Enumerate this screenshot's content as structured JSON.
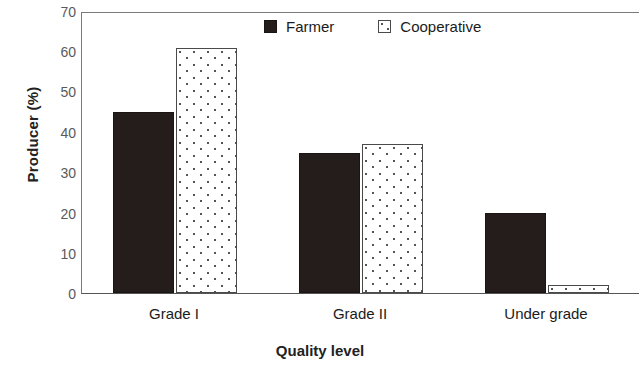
{
  "chart_data": {
    "type": "bar",
    "title": "",
    "categories": [
      "Grade I",
      "Grade II",
      "Under grade"
    ],
    "series": [
      {
        "name": "Farmer",
        "values": [
          45,
          35,
          20
        ],
        "color": "#241d1c",
        "fill": "solid"
      },
      {
        "name": "Cooperative",
        "values": [
          61,
          37,
          2
        ],
        "color": "#ffffff",
        "fill": "dotted-pattern"
      }
    ],
    "xlabel": "Quality level",
    "ylabel": "Producer (%)",
    "ylim": [
      0,
      70
    ],
    "ytick_step": 10,
    "yticks": [
      0,
      10,
      20,
      30,
      40,
      50,
      60,
      70
    ],
    "grid": false,
    "legend_position": "top-center"
  },
  "axes": {
    "y_title": "Producer (%)",
    "x_title": "Quality level",
    "y_tick_labels": [
      "70",
      "60",
      "50",
      "40",
      "30",
      "20",
      "10",
      "0"
    ]
  },
  "legend": {
    "items": [
      {
        "label": "Farmer",
        "swatch": "solid-dark-square-icon"
      },
      {
        "label": "Cooperative",
        "swatch": "patterned-white-square-icon"
      }
    ]
  },
  "categories": [
    {
      "label": "Grade I"
    },
    {
      "label": "Grade II"
    },
    {
      "label": "Under grade"
    }
  ]
}
